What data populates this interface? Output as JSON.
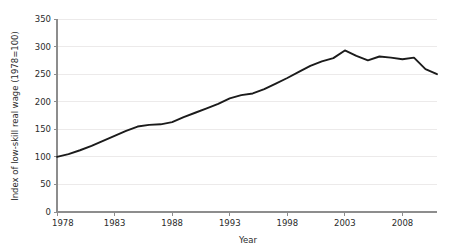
{
  "chart_data": {
    "type": "line",
    "title": "",
    "xlabel": "Year",
    "ylabel": "Index of low-skill real wage (1978=100)",
    "xlim": [
      1978,
      2011
    ],
    "ylim": [
      0,
      350
    ],
    "grid": true,
    "legend": "none",
    "xticks": [
      1978,
      1983,
      1988,
      1993,
      1998,
      2003,
      2008
    ],
    "xtick_labels": [
      "1978",
      "1983",
      "1988",
      "1993",
      "1998",
      "2003",
      "2008"
    ],
    "yticks": [
      0,
      50,
      100,
      150,
      200,
      250,
      300,
      350
    ],
    "ytick_labels": [
      "0",
      "50",
      "100",
      "150",
      "200",
      "250",
      "300",
      "350"
    ],
    "series": [
      {
        "name": "Index of low-skill real wage",
        "color": "#1b1b1b",
        "x": [
          1978,
          1979,
          1980,
          1981,
          1982,
          1983,
          1984,
          1985,
          1986,
          1987,
          1988,
          1989,
          1990,
          1991,
          1992,
          1993,
          1994,
          1995,
          1996,
          1997,
          1998,
          1999,
          2000,
          2001,
          2002,
          2003,
          2004,
          2005,
          2006,
          2007,
          2008,
          2009,
          2010,
          2011
        ],
        "y": [
          100,
          105,
          112,
          120,
          129,
          138,
          147,
          155,
          158,
          159,
          163,
          172,
          180,
          188,
          196,
          206,
          212,
          215,
          223,
          233,
          243,
          254,
          265,
          273,
          279,
          293,
          283,
          275,
          282,
          280,
          277,
          280,
          259,
          250
        ]
      }
    ],
    "annotations": []
  },
  "axes": {
    "y_axis_label": "Index of low-skill real wage (1978=100)",
    "x_axis_label": "Year"
  }
}
